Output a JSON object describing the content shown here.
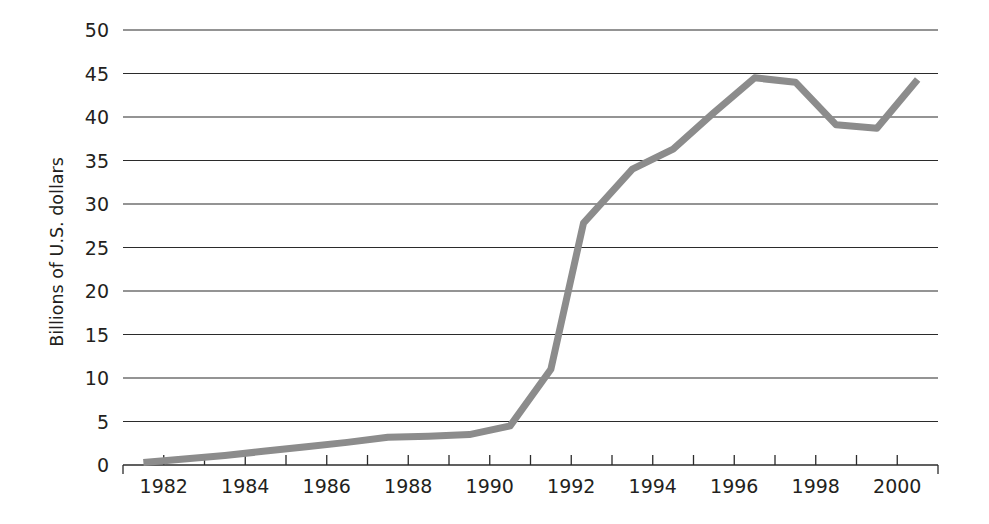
{
  "chart_data": {
    "type": "line",
    "title": "",
    "subtitle": "",
    "xlabel": "",
    "ylabel": "Billions of U.S. dollars",
    "xlim": [
      1981,
      2001
    ],
    "ylim": [
      0,
      50
    ],
    "grid": true,
    "legend": null,
    "y_ticks": [
      0,
      5,
      10,
      15,
      20,
      25,
      30,
      35,
      40,
      45,
      50
    ],
    "y_tick_labels": [
      "0",
      "5",
      "10",
      "15",
      "20",
      "25",
      "30",
      "35",
      "40",
      "45",
      "50"
    ],
    "x_ticks": [
      1981,
      1982,
      1983,
      1984,
      1985,
      1986,
      1987,
      1988,
      1989,
      1990,
      1991,
      1992,
      1993,
      1994,
      1995,
      1996,
      1997,
      1998,
      1999,
      2000,
      2001
    ],
    "x_tick_labels": [
      "1982",
      "1984",
      "1986",
      "1988",
      "1990",
      "1992",
      "1994",
      "1996",
      "1998",
      "2000"
    ],
    "x_labeled_ticks": [
      1982,
      1984,
      1986,
      1988,
      1990,
      1992,
      1994,
      1996,
      1998,
      2000
    ],
    "series": [
      {
        "name": "Billions of U.S. dollars",
        "color": "#8c8c8c",
        "line_width": 7,
        "x": [
          1981.5,
          1982.5,
          1983.5,
          1984.5,
          1985.5,
          1986.5,
          1987.5,
          1988.5,
          1989.5,
          1990.5,
          1991.5,
          1992.3,
          1993.5,
          1994.5,
          1995.5,
          1996.5,
          1997.5,
          1998.5,
          1999.5,
          2000.5
        ],
        "y": [
          0.3,
          0.7,
          1.1,
          1.6,
          2.1,
          2.6,
          3.2,
          3.3,
          3.5,
          4.5,
          11.0,
          27.8,
          34.0,
          36.3,
          40.5,
          44.5,
          44.0,
          39.1,
          38.7,
          44.3
        ]
      }
    ]
  },
  "axis": {
    "y_axis_title": "Billions of U.S. dollars",
    "y_labels": [
      "50",
      "45",
      "40",
      "35",
      "30",
      "25",
      "20",
      "15",
      "10",
      "5",
      "0"
    ],
    "x_labels": [
      "1982",
      "1984",
      "1986",
      "1988",
      "1990",
      "1992",
      "1994",
      "1996",
      "1998",
      "2000"
    ]
  },
  "style": {
    "line_color": "#8c8c8c",
    "axis_color": "#2b2b2b",
    "text_color": "#231f20",
    "background": "#ffffff"
  }
}
